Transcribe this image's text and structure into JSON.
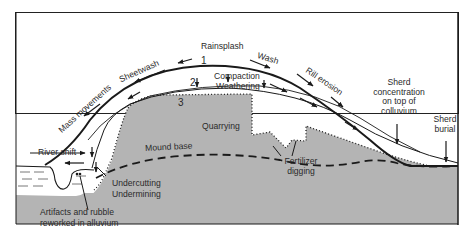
{
  "diagram": {
    "surfaces": [
      "1",
      "2",
      "3"
    ],
    "labels": {
      "rainsplash": "Rainsplash",
      "wash": "Wash",
      "rill_erosion": "Rill erosion",
      "sheetwash": "Sheetwash",
      "mass_movements": "Mass movements",
      "compaction": "Compaction",
      "weathering": "Weathering",
      "quarrying": "Quarrying",
      "mound_base": "Mound base",
      "fertilizer": "Fertilizer",
      "digging": "digging",
      "river_shift": "River shift",
      "undercutting": "Undercutting",
      "undermining": "Undermining",
      "artifacts_line1": "Artifacts and rubble",
      "artifacts_line2": "reworked in alluvium",
      "sherd_conc_line1": "Sherd",
      "sherd_conc_line2": "concentration",
      "sherd_conc_line3": "on top of",
      "sherd_conc_line4": "colluvium",
      "sherd_burial_line1": "Sherd",
      "sherd_burial_line2": "burial"
    },
    "colors": {
      "mound_fill": "#b4b4b4",
      "line": "#1a1a1a",
      "background": "#ffffff",
      "frame": "#222222"
    }
  }
}
